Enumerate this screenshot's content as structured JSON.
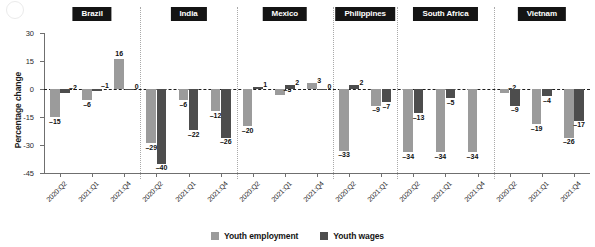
{
  "figure": {
    "corner_mark": "circle-mark"
  },
  "legend": {
    "position": "bottom-center",
    "items": [
      {
        "label": "Youth employment",
        "color": "#9b9b9b",
        "key": "employment"
      },
      {
        "label": "Youth wages",
        "color": "#4d4d4d",
        "key": "wages"
      }
    ]
  },
  "chart_data": {
    "type": "bar",
    "title": "",
    "subtitle": "",
    "xlabel": "",
    "ylabel": "Percentage change",
    "ylim": [
      -45,
      30
    ],
    "yticks": [
      30,
      15,
      0,
      -15,
      -30,
      -45
    ],
    "ytick_labels": [
      "30",
      "15",
      "0",
      "-15",
      "-30",
      "-45"
    ],
    "grid": false,
    "zero_line": true,
    "orientation": "vertical",
    "panel_dividers": true,
    "series": [
      {
        "name": "Youth employment",
        "color": "#9b9b9b"
      },
      {
        "name": "Youth wages",
        "color": "#4d4d4d"
      }
    ],
    "panels": [
      {
        "name": "Brazil",
        "categories": [
          "2020:Q2",
          "2021:Q1",
          "2021:Q4"
        ],
        "employment": [
          -15,
          -6,
          16
        ],
        "wages": [
          -2,
          -1,
          0
        ]
      },
      {
        "name": "India",
        "categories": [
          "2020:Q2",
          "2021:Q1",
          "2021:Q4"
        ],
        "employment": [
          -29,
          -6,
          -12
        ],
        "wages": [
          -40,
          -22,
          -26
        ]
      },
      {
        "name": "Mexico",
        "categories": [
          "2020:Q2",
          "2021:Q1",
          "2021:Q4"
        ],
        "employment": [
          -20,
          -3,
          3
        ],
        "wages": [
          1,
          2,
          0
        ]
      },
      {
        "name": "Philippines",
        "categories": [
          "2020:Q2",
          "2021:Q1"
        ],
        "employment": [
          -33,
          -9
        ],
        "wages": [
          2,
          -7
        ]
      },
      {
        "name": "South Africa",
        "categories": [
          "2020:Q2",
          "2021:Q1",
          "2021:Q4"
        ],
        "employment": [
          -34,
          -34,
          -34
        ],
        "wages": [
          -13,
          -5,
          null
        ]
      },
      {
        "name": "Vietnam",
        "categories": [
          "2020:Q2",
          "2021:Q1",
          "2021:Q4"
        ],
        "employment": [
          -2,
          -19,
          -26
        ],
        "wages": [
          -9,
          -4,
          -17
        ]
      }
    ]
  }
}
